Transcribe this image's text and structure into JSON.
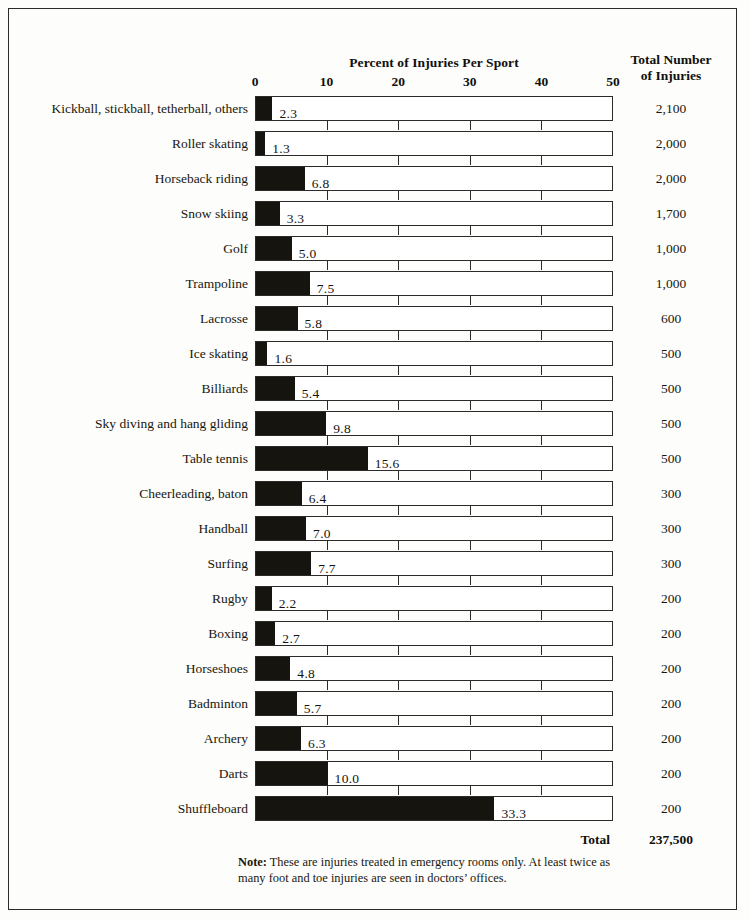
{
  "chart_title": "Percent of Injuries Per Sport",
  "right_column_header_line1": "Total Number",
  "right_column_header_line2": "of Injuries",
  "total_row": {
    "label": "Total",
    "value": "237,500"
  },
  "note": {
    "bold_prefix": "Note:",
    "text": " These are injuries treated in emergency rooms only. At least twice as many foot and toe injuries are seen in doctors’ offices."
  },
  "chart_data": {
    "type": "bar",
    "orientation": "horizontal",
    "title": "Percent of Injuries Per Sport",
    "xlabel": "Percent of Injuries Per Sport",
    "ylabel": "",
    "xlim": [
      0,
      50
    ],
    "xticks": [
      0,
      10,
      20,
      30,
      40,
      50
    ],
    "xtick_labels": [
      "0",
      "10",
      "20",
      "30",
      "40",
      "50"
    ],
    "grid": false,
    "legend": null,
    "bar_color": "#15140f",
    "bar_outline_color": "#2b2a28",
    "categories": [
      "Kickball, stickball, tetherball, others",
      "Roller skating",
      "Horseback riding",
      "Snow skiing",
      "Golf",
      "Trampoline",
      "Lacrosse",
      "Ice skating",
      "Billiards",
      "Sky diving and hang gliding",
      "Table tennis",
      "Cheerleading, baton",
      "Handball",
      "Surfing",
      "Rugby",
      "Boxing",
      "Horseshoes",
      "Badminton",
      "Archery",
      "Darts",
      "Shuffleboard"
    ],
    "values": [
      2.3,
      1.3,
      6.8,
      3.3,
      5.0,
      7.5,
      5.8,
      1.6,
      5.4,
      9.8,
      15.6,
      6.4,
      7.0,
      7.7,
      2.2,
      2.7,
      4.8,
      5.7,
      6.3,
      10.0,
      33.3
    ],
    "value_labels": [
      "2.3",
      "1.3",
      "6.8",
      "3.3",
      "5.0",
      "7.5",
      "5.8",
      "1.6",
      "5.4",
      "9.8",
      "15.6",
      "6.4",
      "7.0",
      "7.7",
      "2.2",
      "2.7",
      "4.8",
      "5.7",
      "6.3",
      "10.0",
      "33.3"
    ],
    "secondary_series": {
      "name": "Total Number of Injuries",
      "values": [
        "2,100",
        "2,000",
        "2,000",
        "1,700",
        "1,000",
        "1,000",
        "600",
        "500",
        "500",
        "500",
        "500",
        "300",
        "300",
        "300",
        "200",
        "200",
        "200",
        "200",
        "200",
        "200",
        "200"
      ],
      "total": "237,500"
    }
  }
}
